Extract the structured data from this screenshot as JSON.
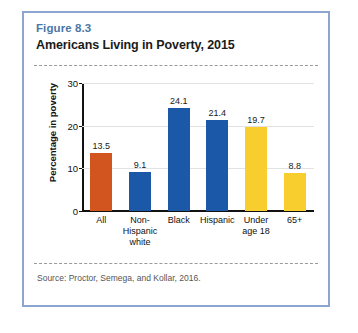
{
  "figure": {
    "label": "Figure 8.3",
    "title": "Americans Living in Poverty, 2015",
    "source": "Source: Proctor, Semega, and Kollar, 2016.",
    "border_color": "#8ea5d2",
    "label_color": "#4a77a8"
  },
  "chart_data": {
    "type": "bar",
    "title": "Americans Living in Poverty, 2015",
    "xlabel": "",
    "ylabel": "Percentage in poverty",
    "ylim": [
      0,
      30
    ],
    "yticks": [
      "0",
      "10",
      "20",
      "30"
    ],
    "grid": true,
    "legend": "none",
    "categories": [
      "All",
      "Non-Hispanic white",
      "Black",
      "Hispanic",
      "Under age 18",
      "65+"
    ],
    "category_lines": [
      [
        "All"
      ],
      [
        "Non-",
        "Hispanic",
        "white"
      ],
      [
        "Black"
      ],
      [
        "Hispanic"
      ],
      [
        "Under",
        "age 18"
      ],
      [
        "65+"
      ]
    ],
    "values": [
      13.5,
      9.1,
      24.1,
      21.4,
      19.7,
      8.8
    ],
    "value_labels": [
      "13.5",
      "9.1",
      "24.1",
      "21.4",
      "19.7",
      "8.8"
    ],
    "bar_colors": [
      "#d2551f",
      "#1b59a8",
      "#1b59a8",
      "#1b59a8",
      "#f7ce2e",
      "#f7ce2e"
    ]
  }
}
